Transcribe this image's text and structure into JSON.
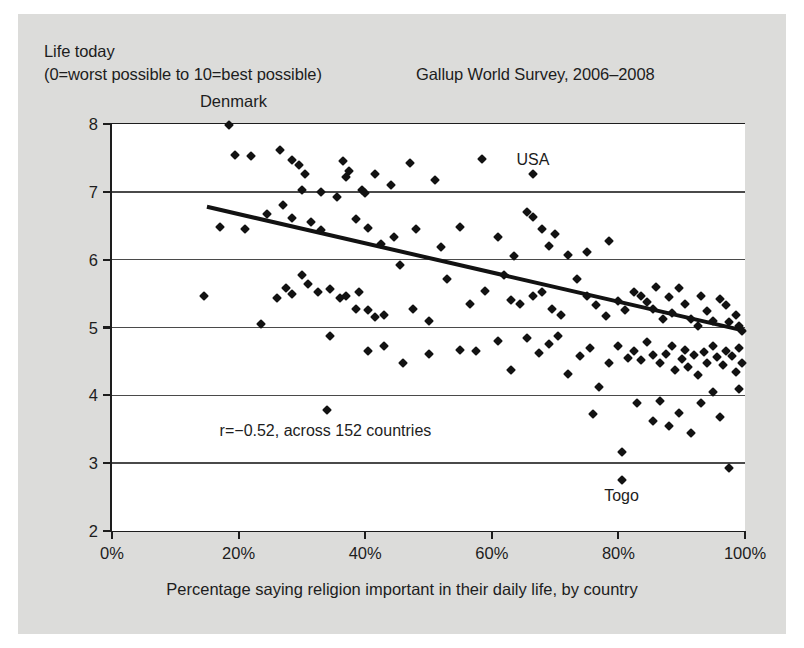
{
  "header": {
    "y_axis_title_line1": "Life today",
    "y_axis_title_line2": "(0=worst possible to 10=best possible)",
    "survey_title": "Gallup World Survey, 2006–2008"
  },
  "colors": {
    "figure_background": "#dcdcda",
    "plot_background": "#ffffff",
    "axis": "#1d1d1d",
    "gridline": "#4a4a4a",
    "marker": "#121212",
    "fit_line": "#121212"
  },
  "chart_data": {
    "type": "scatter",
    "title": "Gallup World Survey, 2006–2008",
    "xlabel": "Percentage saying religion important in their daily life, by country",
    "ylabel": "Life today (0=worst possible to 10=best possible)",
    "xlim": [
      0,
      100
    ],
    "ylim": [
      2,
      8
    ],
    "xticks": [
      0,
      20,
      40,
      60,
      80,
      100
    ],
    "xticklabels": [
      "0%",
      "20%",
      "40%",
      "60%",
      "80%",
      "100%"
    ],
    "yticks": [
      2,
      3,
      4,
      5,
      6,
      7,
      8
    ],
    "yticklabels": [
      "2",
      "3",
      "4",
      "5",
      "6",
      "7",
      "8"
    ],
    "grid": "horizontal",
    "legend": "none",
    "correlation": -0.52,
    "n_countries": 152,
    "annotations": [
      {
        "text": "r=−0.52, across 152 countries",
        "x": 17,
        "y": 3.47,
        "align": "left"
      },
      {
        "text": "Denmark",
        "x": 19.5,
        "y": 8.32,
        "align": "center"
      },
      {
        "text": "USA",
        "x": 66.5,
        "y": 7.47,
        "align": "center"
      },
      {
        "text": "Togo",
        "x": 80.5,
        "y": 2.52,
        "align": "center"
      }
    ],
    "fit_line": {
      "x": [
        15,
        100
      ],
      "y": [
        6.78,
        4.95
      ]
    },
    "points": [
      [
        18.5,
        7.98
      ],
      [
        19.5,
        7.55
      ],
      [
        22.0,
        7.53
      ],
      [
        26.5,
        7.62
      ],
      [
        28.5,
        7.47
      ],
      [
        29.5,
        7.4
      ],
      [
        30.5,
        7.27
      ],
      [
        30.0,
        7.02
      ],
      [
        33.0,
        7.0
      ],
      [
        36.5,
        7.46
      ],
      [
        37.5,
        7.3
      ],
      [
        37.0,
        7.22
      ],
      [
        39.5,
        7.02
      ],
      [
        40.0,
        6.98
      ],
      [
        41.5,
        7.26
      ],
      [
        44.0,
        7.1
      ],
      [
        47.0,
        7.43
      ],
      [
        51.0,
        7.17
      ],
      [
        58.5,
        7.48
      ],
      [
        66.5,
        7.27
      ],
      [
        17.0,
        6.48
      ],
      [
        21.0,
        6.45
      ],
      [
        24.5,
        6.68
      ],
      [
        27.0,
        6.8
      ],
      [
        28.5,
        6.62
      ],
      [
        31.5,
        6.55
      ],
      [
        33.0,
        6.44
      ],
      [
        35.5,
        6.92
      ],
      [
        38.5,
        6.6
      ],
      [
        40.5,
        6.46
      ],
      [
        42.5,
        6.23
      ],
      [
        44.5,
        6.34
      ],
      [
        48.0,
        6.45
      ],
      [
        52.0,
        6.18
      ],
      [
        55.0,
        6.48
      ],
      [
        61.0,
        6.34
      ],
      [
        63.5,
        6.06
      ],
      [
        65.5,
        6.7
      ],
      [
        66.5,
        6.63
      ],
      [
        68.0,
        6.45
      ],
      [
        69.0,
        6.2
      ],
      [
        70.0,
        6.38
      ],
      [
        72.0,
        6.07
      ],
      [
        75.0,
        6.12
      ],
      [
        78.5,
        6.27
      ],
      [
        14.5,
        5.47
      ],
      [
        23.5,
        5.05
      ],
      [
        26.0,
        5.44
      ],
      [
        27.5,
        5.58
      ],
      [
        28.5,
        5.5
      ],
      [
        30.0,
        5.77
      ],
      [
        31.0,
        5.64
      ],
      [
        32.5,
        5.52
      ],
      [
        34.5,
        5.57
      ],
      [
        36.0,
        5.44
      ],
      [
        37.0,
        5.46
      ],
      [
        38.5,
        5.28
      ],
      [
        39.0,
        5.52
      ],
      [
        40.5,
        5.26
      ],
      [
        41.5,
        5.16
      ],
      [
        43.0,
        5.18
      ],
      [
        45.5,
        5.92
      ],
      [
        47.5,
        5.27
      ],
      [
        50.0,
        5.1
      ],
      [
        53.0,
        5.72
      ],
      [
        56.5,
        5.34
      ],
      [
        59.0,
        5.54
      ],
      [
        62.0,
        5.77
      ],
      [
        63.0,
        5.41
      ],
      [
        64.5,
        5.35
      ],
      [
        66.5,
        5.47
      ],
      [
        68.0,
        5.52
      ],
      [
        69.5,
        5.28
      ],
      [
        71.0,
        5.18
      ],
      [
        73.5,
        5.72
      ],
      [
        75.0,
        5.46
      ],
      [
        76.5,
        5.33
      ],
      [
        78.0,
        5.17
      ],
      [
        80.0,
        5.39
      ],
      [
        81.0,
        5.26
      ],
      [
        82.5,
        5.53
      ],
      [
        83.5,
        5.46
      ],
      [
        84.5,
        5.37
      ],
      [
        85.5,
        5.28
      ],
      [
        86.0,
        5.6
      ],
      [
        87.0,
        5.12
      ],
      [
        88.0,
        5.45
      ],
      [
        88.5,
        5.22
      ],
      [
        89.5,
        5.58
      ],
      [
        90.5,
        5.35
      ],
      [
        91.5,
        5.12
      ],
      [
        92.5,
        5.02
      ],
      [
        93.0,
        5.47
      ],
      [
        94.0,
        5.25
      ],
      [
        95.0,
        5.1
      ],
      [
        96.0,
        5.42
      ],
      [
        97.0,
        5.33
      ],
      [
        97.5,
        5.08
      ],
      [
        98.5,
        5.18
      ],
      [
        99.0,
        5.02
      ],
      [
        34.0,
        3.78
      ],
      [
        34.5,
        4.88
      ],
      [
        40.5,
        4.65
      ],
      [
        43.0,
        4.72
      ],
      [
        46.0,
        4.48
      ],
      [
        50.0,
        4.61
      ],
      [
        55.0,
        4.67
      ],
      [
        57.5,
        4.66
      ],
      [
        61.0,
        4.8
      ],
      [
        63.0,
        4.37
      ],
      [
        65.5,
        4.84
      ],
      [
        67.5,
        4.62
      ],
      [
        69.0,
        4.76
      ],
      [
        70.5,
        4.88
      ],
      [
        72.0,
        4.32
      ],
      [
        74.0,
        4.58
      ],
      [
        75.5,
        4.7
      ],
      [
        77.0,
        4.12
      ],
      [
        78.5,
        4.48
      ],
      [
        80.0,
        4.72
      ],
      [
        81.5,
        4.55
      ],
      [
        82.5,
        4.66
      ],
      [
        83.5,
        4.52
      ],
      [
        84.5,
        4.78
      ],
      [
        85.5,
        4.6
      ],
      [
        86.5,
        4.47
      ],
      [
        87.5,
        4.61
      ],
      [
        88.5,
        4.73
      ],
      [
        89.0,
        4.38
      ],
      [
        90.0,
        4.54
      ],
      [
        90.5,
        4.67
      ],
      [
        91.0,
        4.42
      ],
      [
        92.0,
        4.59
      ],
      [
        92.5,
        4.3
      ],
      [
        93.5,
        4.64
      ],
      [
        94.0,
        4.48
      ],
      [
        95.0,
        4.72
      ],
      [
        95.5,
        4.56
      ],
      [
        96.5,
        4.44
      ],
      [
        97.0,
        4.66
      ],
      [
        98.0,
        4.58
      ],
      [
        98.5,
        4.35
      ],
      [
        99.0,
        4.7
      ],
      [
        99.5,
        4.48
      ],
      [
        76.0,
        3.72
      ],
      [
        80.5,
        3.17
      ],
      [
        80.5,
        2.75
      ],
      [
        83.0,
        3.88
      ],
      [
        85.5,
        3.62
      ],
      [
        86.5,
        3.92
      ],
      [
        88.0,
        3.55
      ],
      [
        89.5,
        3.74
      ],
      [
        91.5,
        3.45
      ],
      [
        93.0,
        3.88
      ],
      [
        95.0,
        4.05
      ],
      [
        96.0,
        3.68
      ],
      [
        97.5,
        2.93
      ],
      [
        99.0,
        4.1
      ],
      [
        99.5,
        4.95
      ]
    ]
  }
}
